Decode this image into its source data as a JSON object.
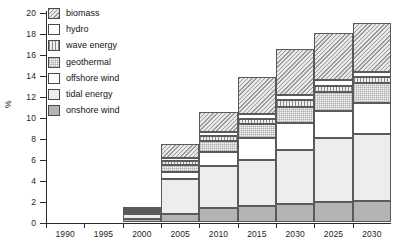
{
  "chart_data": {
    "type": "bar",
    "subtype": "stacked-bar",
    "title": "",
    "xlabel": "",
    "ylabel": "%",
    "ylim": [
      0,
      20
    ],
    "ytick_step": 2,
    "yticks": [
      0,
      2,
      4,
      6,
      8,
      10,
      12,
      14,
      16,
      18,
      20
    ],
    "grid": false,
    "legend_position": "top-left",
    "categories": [
      "1990",
      "1995",
      "2000",
      "2005",
      "2010",
      "2015",
      "2030",
      "2025",
      "2030"
    ],
    "series": [
      {
        "name": "onshore wind",
        "fill": "solid-grey",
        "values": [
          0,
          0,
          0.25,
          0.8,
          1.3,
          1.5,
          1.7,
          1.9,
          2.0
        ]
      },
      {
        "name": "tidal energy",
        "fill": "light-grey",
        "values": [
          0,
          0,
          0.55,
          3.3,
          4.0,
          4.4,
          5.2,
          6.1,
          6.4
        ]
      },
      {
        "name": "offshore wind",
        "fill": "white",
        "values": [
          0,
          0,
          0.1,
          0.7,
          1.4,
          2.1,
          2.5,
          2.6,
          2.9
        ]
      },
      {
        "name": "geothermal",
        "fill": "fine-grid",
        "values": [
          0,
          0,
          0.15,
          0.6,
          1.0,
          1.3,
          1.6,
          1.8,
          1.9
        ]
      },
      {
        "name": "wave energy",
        "fill": "vertical-lines",
        "values": [
          0,
          0,
          0.1,
          0.4,
          0.5,
          0.5,
          0.6,
          0.6,
          0.6
        ]
      },
      {
        "name": "hydro",
        "fill": "white",
        "values": [
          0,
          0,
          0.05,
          0.3,
          0.4,
          0.5,
          0.5,
          0.5,
          0.5
        ]
      },
      {
        "name": "biomass",
        "fill": "diagonal-hatch",
        "values": [
          0,
          0,
          0.1,
          1.3,
          1.9,
          3.5,
          4.4,
          4.5,
          4.7
        ]
      }
    ],
    "totals": [
      0,
      0,
      1.3,
      7.4,
      10.5,
      13.8,
      16.5,
      18.0,
      19.0
    ]
  },
  "legend": {
    "items": [
      {
        "label": "biomass",
        "key": "biomass"
      },
      {
        "label": "hydro",
        "key": "hydro"
      },
      {
        "label": "wave energy",
        "key": "wave"
      },
      {
        "label": "geothermal",
        "key": "geothermal"
      },
      {
        "label": "offshore wind",
        "key": "offshore"
      },
      {
        "label": "tidal energy",
        "key": "tidal"
      },
      {
        "label": "onshore wind",
        "key": "onshore"
      }
    ]
  },
  "axes": {
    "y_title": "%",
    "y_labels": [
      "20",
      "18",
      "16",
      "14",
      "12",
      "10",
      "8",
      "6",
      "4",
      "2",
      "0"
    ],
    "x_labels": [
      "1990",
      "1995",
      "2000",
      "2005",
      "2010",
      "2015",
      "2030",
      "2025",
      "2030"
    ]
  },
  "colors": {
    "axis": "#2b2b2b",
    "text": "#1a1a1a",
    "onshore_wind": "#b4b4b4",
    "tidal_energy": "#ededed",
    "biomass": "#e8e8e8",
    "background": "#ffffff"
  }
}
